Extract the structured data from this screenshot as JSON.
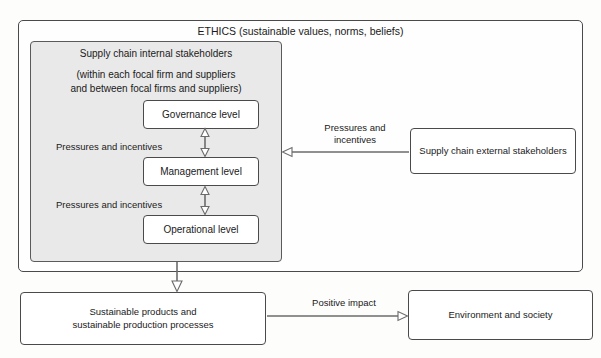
{
  "diagram": {
    "title": "ETHICS (sustainable values, norms, beliefs)",
    "internal_panel": {
      "title": "Supply chain internal stakeholders",
      "subtitle": "(within each focal firm and suppliers\nand between focal firms and suppliers)",
      "levels": [
        {
          "label": "Governance level"
        },
        {
          "label": "Management level"
        },
        {
          "label": "Operational level"
        }
      ],
      "pressure_labels": [
        "Pressures and incentives",
        "Pressures and incentives"
      ]
    },
    "external": {
      "box_label": "Supply chain external stakeholders",
      "arrow_label": "Pressures and\nincentives"
    },
    "outcomes": {
      "products_label": "Sustainable products and\nsustainable production processes",
      "impact_arrow_label": "Positive impact",
      "environment_label": "Environment and society"
    },
    "colors": {
      "panel_fill": "#e9e9e9",
      "border": "#4a4a4a",
      "arrow": "#6b6b6b",
      "text": "#1a1a1a",
      "background": "#fdfdfc"
    }
  }
}
